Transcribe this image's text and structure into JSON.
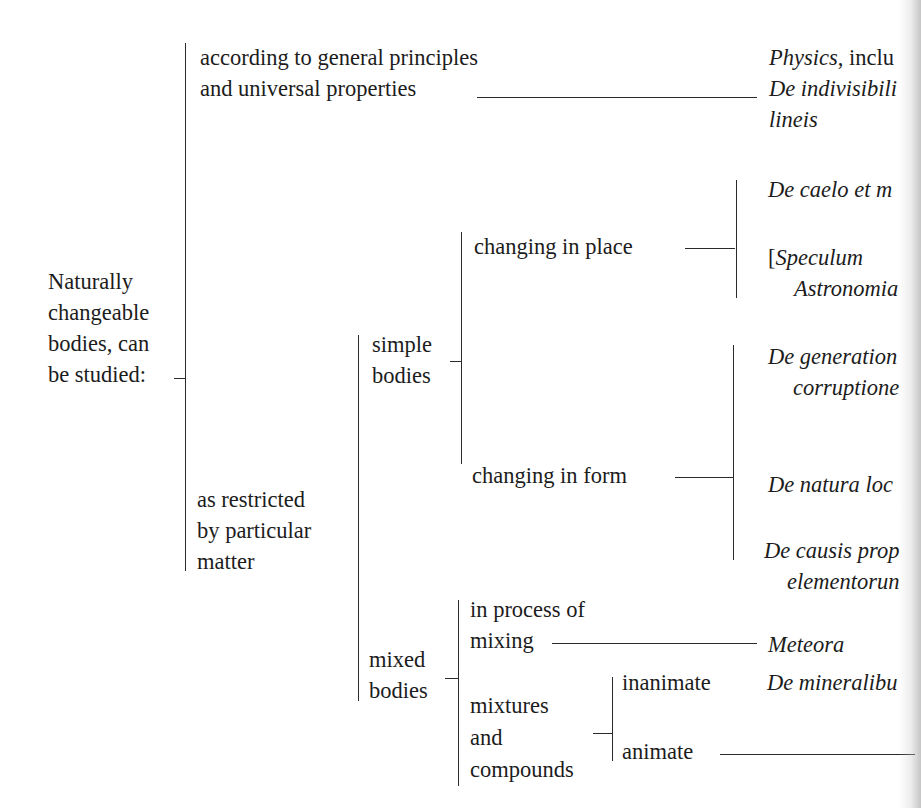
{
  "diagram": {
    "type": "bracket-tree",
    "root": {
      "label_lines": [
        "Naturally",
        "changeable",
        "bodies, can",
        "be studied:"
      ]
    },
    "branches": {
      "general": {
        "label_lines": [
          "according to general principles",
          "and universal properties"
        ],
        "works": {
          "line1_italic": "Physics",
          "line1_rest": ", inclu",
          "line2": "De indivisibili",
          "line3": "lineis"
        }
      },
      "restricted": {
        "label_lines": [
          "as restricted",
          "by particular",
          "matter"
        ],
        "simple": {
          "label_lines": [
            "simple",
            "bodies"
          ],
          "place": {
            "label": "changing in place",
            "works": [
              "De caelo et m",
              "[",
              "Speculum",
              "Astronomia"
            ]
          },
          "form": {
            "label": "changing in form",
            "works": [
              "De generation",
              "corruptione",
              "De natura loc",
              "De causis prop",
              "elementorun"
            ]
          }
        },
        "mixed": {
          "label_lines": [
            "mixed",
            "bodies"
          ],
          "process": {
            "label_lines": [
              "in process of",
              "mixing"
            ],
            "work": "Meteora"
          },
          "compounds": {
            "label_lines": [
              "mixtures",
              "and",
              "compounds"
            ],
            "inanimate": {
              "label": "inanimate",
              "work": "De mineralibu"
            },
            "animate": {
              "label": "animate"
            }
          }
        }
      }
    }
  }
}
